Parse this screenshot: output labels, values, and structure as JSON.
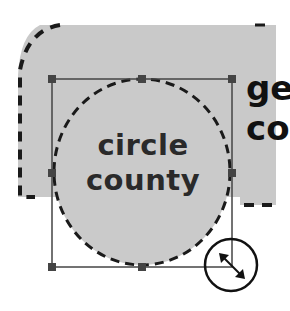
{
  "canvas": {
    "background": "#ffffff",
    "shape_fill": "#c8c8c8",
    "outline_color": "#1a1a1a",
    "handle_color": "#444444"
  },
  "shapes": {
    "background_region": {
      "label_partial_line1": "ge",
      "label_partial_line2": "co"
    },
    "circle": {
      "label_line1": "circle",
      "label_line2": "county"
    }
  },
  "selection": {
    "handles": 8,
    "cursor": "resize-diagonal-cursor"
  }
}
